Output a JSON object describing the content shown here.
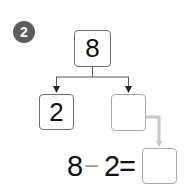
{
  "problem": {
    "number": "2"
  },
  "tree": {
    "whole": "8",
    "part_known": "2",
    "part_unknown": ""
  },
  "equation": {
    "operand_a": "8",
    "operator": "−",
    "operand_b": "2",
    "equals": "=",
    "answer": ""
  },
  "colors": {
    "badge": "#5b5b5b",
    "box_border": "#6e6e6e",
    "empty_box_border": "#a8a8a8",
    "guide_arrow": "#c8c8c8",
    "minus_sign": "#9a9a9a"
  }
}
